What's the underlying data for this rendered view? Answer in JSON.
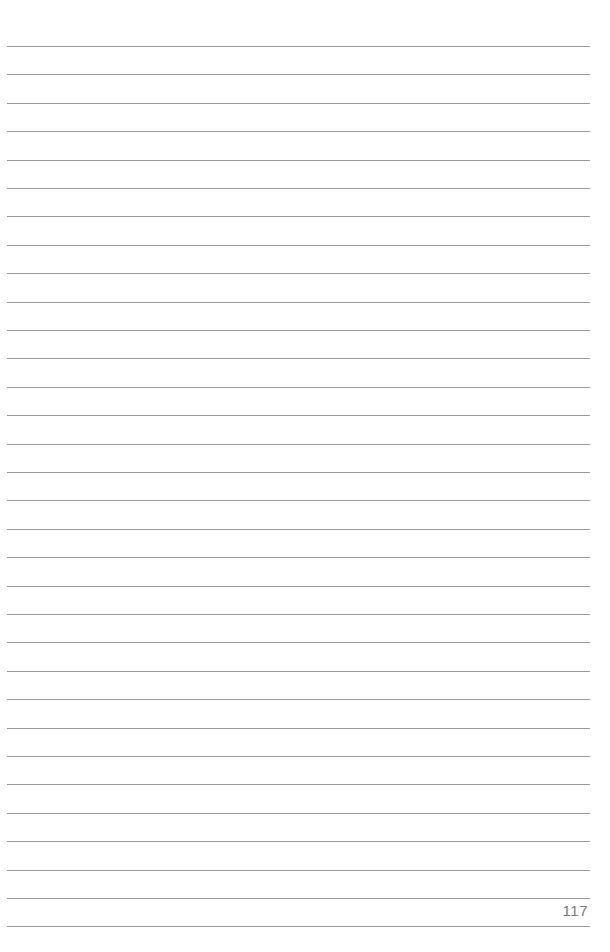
{
  "page": {
    "number": "117",
    "rule_count": 32,
    "rule_color": "#9a9a9a",
    "first_rule_y": 46,
    "rule_spacing": 28.4
  }
}
